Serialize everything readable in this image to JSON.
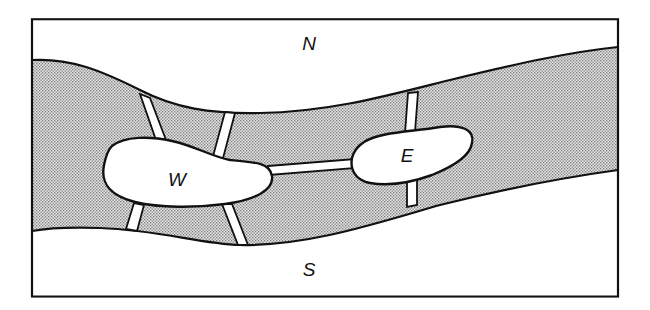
{
  "figure": {
    "landmasses": [
      {
        "id": "north-bank",
        "label": "N"
      },
      {
        "id": "south-bank",
        "label": "S"
      },
      {
        "id": "west-island",
        "label": "W"
      },
      {
        "id": "east-island",
        "label": "E"
      }
    ],
    "bridges": [
      {
        "connects": [
          "N",
          "W"
        ]
      },
      {
        "connects": [
          "N",
          "W"
        ]
      },
      {
        "connects": [
          "S",
          "W"
        ]
      },
      {
        "connects": [
          "S",
          "W"
        ]
      },
      {
        "connects": [
          "W",
          "E"
        ]
      },
      {
        "connects": [
          "N",
          "E"
        ]
      },
      {
        "connects": [
          "S",
          "E"
        ]
      }
    ],
    "colors": {
      "line": "#111111",
      "river_fill": "#d6d6d6",
      "river_dots": "#8a8a8a",
      "land": "#ffffff"
    }
  }
}
